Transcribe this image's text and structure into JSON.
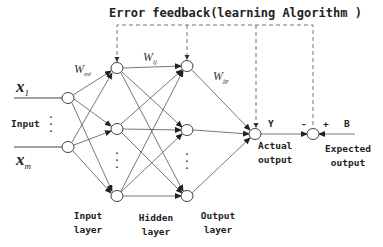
{
  "title": "Error feedback(learning Algorithm )",
  "inputs": {
    "x1": {
      "base": "x",
      "sub": "1"
    },
    "xm": {
      "base": "x",
      "sub": "m"
    },
    "label": "Input"
  },
  "weights": {
    "w_mi": {
      "base": "W",
      "sub": "mi"
    },
    "w_ij": {
      "base": "W",
      "sub": "ij"
    },
    "w_jp": {
      "base": "W",
      "sub": "jp"
    }
  },
  "layers": [
    {
      "line1": "Input",
      "line2": "layer"
    },
    {
      "line1": "Hidden",
      "line2": "layer"
    },
    {
      "line1": "Output",
      "line2": "layer"
    }
  ],
  "output": {
    "y_label": "Y",
    "actual_line1": "Actual",
    "actual_line2": "output",
    "minus": "-",
    "plus": "+",
    "b_label": "B",
    "expected_line1": "Expected",
    "expected_line2": "output"
  },
  "ellipsis": "⋮",
  "colors": {
    "line": "#444444",
    "dashed": "#666666",
    "node_fill": "#ffffff",
    "text": "#222222"
  }
}
